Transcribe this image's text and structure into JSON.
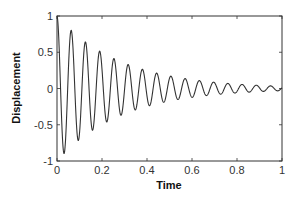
{
  "chart_data": {
    "type": "line",
    "title": "",
    "xlabel": "Time",
    "ylabel": "Displacement",
    "xlim": [
      0,
      1
    ],
    "ylim": [
      -1,
      1
    ],
    "grid": false,
    "legend": null,
    "xticks": [
      "0",
      "0.2",
      "0.4",
      "0.6",
      "0.8",
      "1"
    ],
    "yticks": [
      "1",
      "0.5",
      "0",
      "-0.5",
      "-1"
    ],
    "series": [
      {
        "name": "damped oscillation",
        "color": "#333333",
        "model": "x(t) = exp(-3.5 t) * cos(2*pi*15.8*t)",
        "decay_rate": 3.5,
        "frequency_hz": 15.8,
        "approx_extrema": [
          {
            "t": 0.0,
            "y": 1.0
          },
          {
            "t": 0.032,
            "y": -0.85
          },
          {
            "t": 0.063,
            "y": 0.74
          },
          {
            "t": 0.095,
            "y": -0.62
          },
          {
            "t": 0.127,
            "y": 0.53
          },
          {
            "t": 0.158,
            "y": -0.46
          },
          {
            "t": 0.19,
            "y": 0.38
          },
          {
            "t": 0.253,
            "y": 0.28
          },
          {
            "t": 0.316,
            "y": 0.21
          },
          {
            "t": 0.38,
            "y": 0.16
          },
          {
            "t": 0.5,
            "y": 0.09
          },
          {
            "t": 0.63,
            "y": 0.05
          },
          {
            "t": 0.8,
            "y": 0.02
          },
          {
            "t": 1.0,
            "y": 0.0
          }
        ]
      }
    ]
  }
}
